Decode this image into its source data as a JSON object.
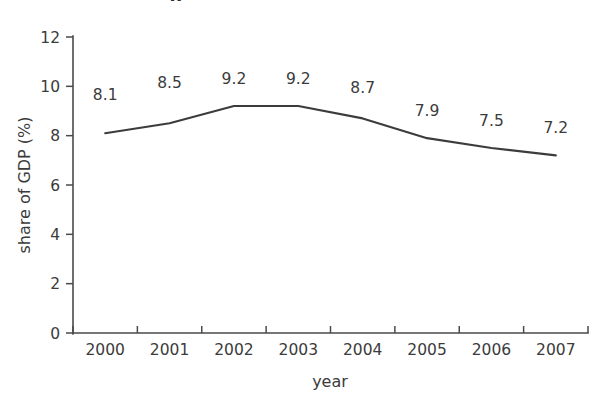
{
  "figure": {
    "background_color": "#ffffff",
    "line_color": "#3c3c3c",
    "text_color": "#3b3b3b",
    "axis_color": "#4a4a4a",
    "cropped_title_fragment": "g"
  },
  "chart_data": {
    "type": "line",
    "title": "",
    "subtitle": "",
    "xlabel": "year",
    "ylabel": "share of GDP (%)",
    "categories": [
      "2000",
      "2001",
      "2002",
      "2003",
      "2004",
      "2005",
      "2006",
      "2007"
    ],
    "values": [
      8.1,
      8.5,
      9.2,
      9.2,
      8.7,
      7.9,
      7.5,
      7.2
    ],
    "point_labels": [
      "8.1",
      "8.5",
      "9.2",
      "9.2",
      "8.7",
      "7.9",
      "7.5",
      "7.2"
    ],
    "ylim": [
      0,
      12
    ],
    "yticks": [
      0,
      2,
      4,
      6,
      8,
      10,
      12
    ],
    "ytick_labels": [
      "0",
      "2",
      "4",
      "6",
      "8",
      "10",
      "12"
    ],
    "xtick_labels": [
      "2000",
      "2001",
      "2002",
      "2003",
      "2004",
      "2005",
      "2006",
      "2007"
    ],
    "grid": false,
    "legend": null,
    "legend_position": "none",
    "series": [
      {
        "name": "share of GDP (%)",
        "values": [
          8.1,
          8.5,
          9.2,
          9.2,
          8.7,
          7.9,
          7.5,
          7.2
        ]
      }
    ]
  }
}
